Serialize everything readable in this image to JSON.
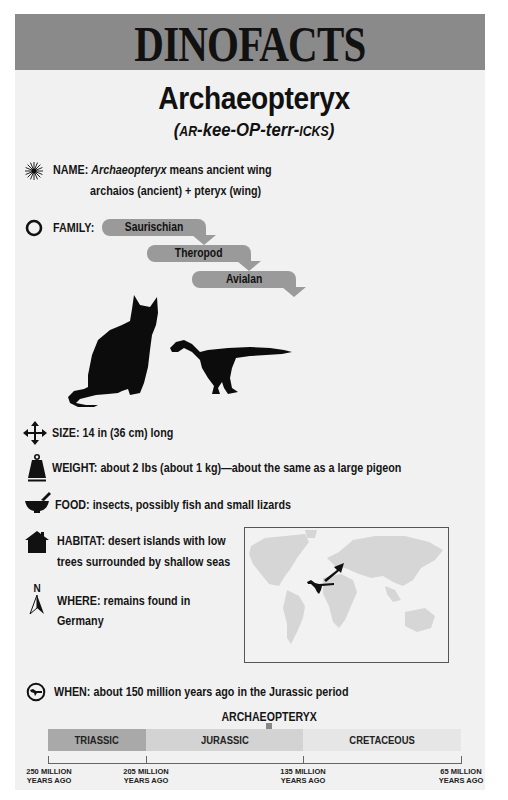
{
  "header": {
    "banner_title": "DINOFACTS",
    "species_name": "Archaeopteryx",
    "pronunciation": {
      "open": "(",
      "p1_smallcaps": "AR",
      "p2": "-kee-OP-terr-",
      "p3_smallcaps": "ICKS",
      "close": ")"
    }
  },
  "facts": {
    "name": {
      "icon": "starburst-icon",
      "label": "NAME:",
      "italic": "Archaeopteryx",
      "text": " means ancient wing",
      "line2": "archaios (ancient) + pteryx (wing)"
    },
    "family": {
      "icon": "ring-icon",
      "label": "FAMILY:",
      "levels": [
        "Saurischian",
        "Theropod",
        "Avialan"
      ]
    },
    "size": {
      "icon": "four-way-arrows-icon",
      "label": "SIZE:",
      "text": " 14 in (36 cm) long"
    },
    "weight": {
      "icon": "weight-icon",
      "label": "WEIGHT:",
      "text": " about 2 lbs (about 1 kg)—about the same as a large pigeon"
    },
    "food": {
      "icon": "mortar-pestle-icon",
      "label": "FOOD:",
      "text": " insects, possibly fish and small lizards"
    },
    "habitat": {
      "icon": "house-icon",
      "label": "HABITAT:",
      "text": " desert islands with low",
      "line2": "trees surrounded by shallow seas"
    },
    "where": {
      "icon": "north-arrow-icon",
      "compass_letter": "N",
      "label": "WHERE:",
      "text": " remains found in",
      "line2": "Germany"
    },
    "when": {
      "icon": "clock-dino-icon",
      "label": "WHEN:",
      "text": " about 150 million years ago in the Jurassic period"
    }
  },
  "illustration": {
    "comparison": [
      "cat-silhouette",
      "archaeopteryx-silhouette"
    ]
  },
  "map": {
    "description": "world map with arrow pointing to Germany",
    "marker": "archaeopteryx-silhouette"
  },
  "timeline": {
    "title": "ARCHAEOPTERYX",
    "periods": [
      {
        "name": "TRIASSIC",
        "color": "#a9a9a9"
      },
      {
        "name": "JURASSIC",
        "color": "#d3d3d3"
      },
      {
        "name": "CRETACEOUS",
        "color": "#e6e6e6"
      }
    ],
    "ticks": [
      {
        "line1": "250 MILLION",
        "line2": "YEARS AGO"
      },
      {
        "line1": "205 MILLION",
        "line2": "YEARS AGO"
      },
      {
        "line1": "135 MILLION",
        "line2": "YEARS AGO"
      },
      {
        "line1": "65 MILLION",
        "line2": "YEARS AGO"
      }
    ]
  },
  "colors": {
    "banner": "#8a8a8a",
    "card": "#f1f1f1",
    "pill": "#9a9a9a",
    "text": "#111111"
  }
}
